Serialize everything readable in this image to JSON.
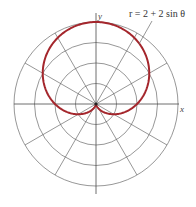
{
  "chart_data": {
    "type": "line",
    "subtype": "polar",
    "title": "",
    "equation_label": "r = 2 + 2 sin θ",
    "xlabel": "x",
    "ylabel": "y",
    "function": "r = 2 + 2*sin(theta)",
    "theta_range_deg": [
      0,
      360
    ],
    "r_max": 4,
    "grid": {
      "rings": [
        1,
        2,
        3,
        4
      ],
      "ray_step_deg": 30
    },
    "series": [
      {
        "name": "r = 2 + 2 sin θ",
        "color": "#a4262c",
        "points_polar": [
          {
            "theta_deg": 0,
            "r": 2.0
          },
          {
            "theta_deg": 30,
            "r": 3.0
          },
          {
            "theta_deg": 60,
            "r": 3.73
          },
          {
            "theta_deg": 90,
            "r": 4.0
          },
          {
            "theta_deg": 120,
            "r": 3.73
          },
          {
            "theta_deg": 150,
            "r": 3.0
          },
          {
            "theta_deg": 180,
            "r": 2.0
          },
          {
            "theta_deg": 210,
            "r": 1.0
          },
          {
            "theta_deg": 240,
            "r": 0.27
          },
          {
            "theta_deg": 270,
            "r": 0.0
          },
          {
            "theta_deg": 300,
            "r": 0.27
          },
          {
            "theta_deg": 330,
            "r": 1.0
          },
          {
            "theta_deg": 360,
            "r": 2.0
          }
        ]
      }
    ]
  },
  "style": {
    "curve_color": "#a4262c",
    "grid_color": "#6a6a6a",
    "center": [
      96,
      104
    ],
    "px_per_unit": 20.5
  }
}
